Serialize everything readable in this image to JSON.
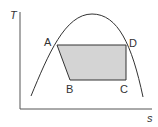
{
  "diagram": {
    "axes": {
      "y_label": "T",
      "x_label": "s"
    },
    "points": {
      "A": "A",
      "B": "B",
      "C": "C",
      "D": "D"
    },
    "colors": {
      "line": "#333333",
      "axis": "#555555",
      "fill": "#d4d4d4",
      "background": "#ffffff"
    }
  }
}
